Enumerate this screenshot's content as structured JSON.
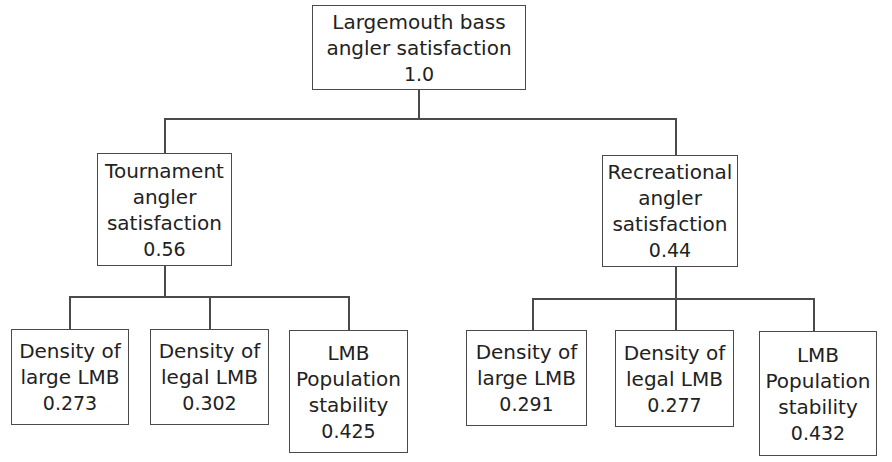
{
  "root": {
    "lines": [
      "Largemouth bass",
      "angler satisfaction"
    ],
    "value": "1.0"
  },
  "branches": [
    {
      "lines": [
        "Tournament",
        "angler",
        "satisfaction"
      ],
      "value": "0.56",
      "children": [
        {
          "lines": [
            "Density of",
            "large LMB"
          ],
          "value": "0.273"
        },
        {
          "lines": [
            "Density of",
            "legal LMB"
          ],
          "value": "0.302"
        },
        {
          "lines": [
            "LMB",
            "Population",
            "stability"
          ],
          "value": "0.425"
        }
      ]
    },
    {
      "lines": [
        "Recreational",
        "angler",
        "satisfaction"
      ],
      "value": "0.44",
      "children": [
        {
          "lines": [
            "Density of",
            "large LMB"
          ],
          "value": "0.291"
        },
        {
          "lines": [
            "Density of",
            "legal LMB"
          ],
          "value": "0.277"
        },
        {
          "lines": [
            "LMB",
            "Population",
            "stability"
          ],
          "value": "0.432"
        }
      ]
    }
  ]
}
